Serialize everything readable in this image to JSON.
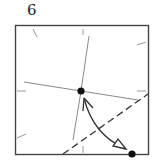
{
  "diagram": {
    "step_number": "6",
    "type": "origami-fold-step",
    "elements": {
      "paper_square": "square outline",
      "creases": [
        "vertical crease",
        "horizontal crease",
        "edge tick marks"
      ],
      "valley_fold_line": "dashed diagonal",
      "arrow": "curved fold arrow from bottom-right corner to center point",
      "points": [
        "center reference point",
        "bottom-right corner point"
      ]
    },
    "colors": {
      "line": "#333333",
      "crease": "#888888",
      "dot": "#111111"
    }
  }
}
